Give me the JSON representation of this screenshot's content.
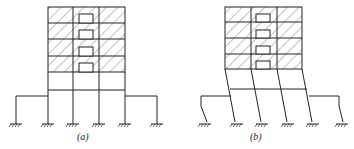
{
  "figure": {
    "panels": [
      {
        "id": "a",
        "label": "(a)",
        "description": "Frame with shear walls, undeformed"
      },
      {
        "id": "b",
        "label": "(b)",
        "description": "Frame with soft-story lateral deformation"
      }
    ],
    "colors": {
      "line": "#222222",
      "hatch": "#333333",
      "background": "#ffffff"
    }
  }
}
